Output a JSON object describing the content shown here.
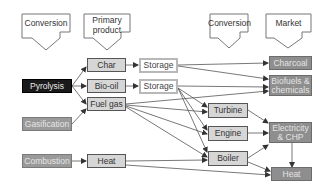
{
  "headers": [
    {
      "id": "conversion-left",
      "label": "Conversion"
    },
    {
      "id": "primary-product",
      "label": "Primary product"
    },
    {
      "id": "conversion-right",
      "label": "Conversion"
    },
    {
      "id": "market",
      "label": "Market"
    }
  ],
  "processes": {
    "pyrolysis": "Pyrolysis",
    "gasification": "Gasification",
    "combustion": "Combustion"
  },
  "products": {
    "char": "Char",
    "bio_oil": "Bio-oil",
    "fuel_gas": "Fuel gas",
    "heat": "Heat"
  },
  "storage": {
    "storage1": "Storage",
    "storage2": "Storage"
  },
  "conversion": {
    "turbine": "Turbine",
    "engine": "Engine",
    "boiler": "Boiler"
  },
  "markets": {
    "charcoal": "Charcoal",
    "biofuels": "Biofuels & chemicals",
    "electricity": "Electricity & CHP",
    "heat": "Heat"
  },
  "colors": {
    "pyrolysis_fill": "#1a1a1a",
    "process_fill": "#9a9a9a",
    "product_fill": "#d6d6d6",
    "market_fill": "#8e8e8e",
    "line": "#444444"
  }
}
